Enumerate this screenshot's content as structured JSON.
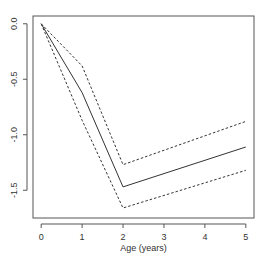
{
  "chart_data": {
    "type": "line",
    "title": "",
    "xlabel": "Age (years)",
    "ylabel": "",
    "x": [
      0,
      1,
      2,
      5
    ],
    "xlim": [
      -0.2,
      5.2
    ],
    "ylim": [
      -1.75,
      0.07
    ],
    "xticks": [
      0,
      1,
      2,
      3,
      4,
      5
    ],
    "xtick_labels": [
      "0",
      "1",
      "2",
      "3",
      "4",
      "5"
    ],
    "yticks": [
      0.0,
      -0.5,
      -1.0,
      -1.5
    ],
    "ytick_labels": [
      "0.0",
      "-0.5",
      "-1.0",
      "-1.5"
    ],
    "grid": false,
    "legend": null,
    "series": [
      {
        "name": "estimate",
        "style": "solid",
        "color": "#333333",
        "values": [
          0.0,
          -0.62,
          -1.47,
          -1.11
        ]
      },
      {
        "name": "upper bound",
        "style": "dashed",
        "color": "#333333",
        "values": [
          0.0,
          -0.38,
          -1.27,
          -0.88
        ]
      },
      {
        "name": "lower bound",
        "style": "dashed",
        "color": "#333333",
        "values": [
          0.0,
          -0.87,
          -1.66,
          -1.32
        ]
      }
    ]
  },
  "plot": {
    "left": 33,
    "top": 16,
    "right": 254,
    "bottom": 218
  }
}
